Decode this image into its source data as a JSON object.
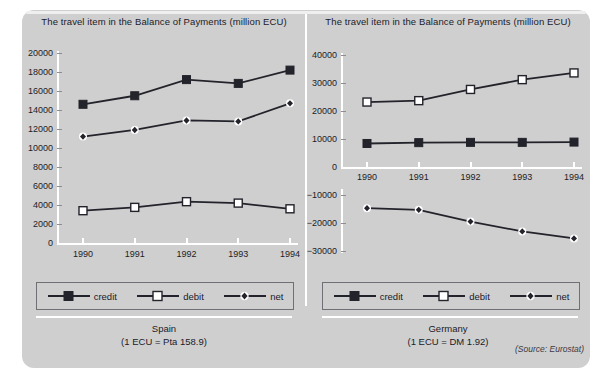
{
  "figure": {
    "source_note": "(Source: Eurostat)",
    "colors": {
      "card_background": "#cfcfcf",
      "page_background": "#ffffff",
      "axis": "#ffffff",
      "series_line": "#23232b",
      "credit_marker_fill": "#23232b",
      "debit_marker_fill": "#ffffff",
      "net_marker_fill": "#23232b",
      "text": "#20202a",
      "legend_border": "#6f6f76"
    }
  },
  "panels": [
    {
      "id": "spain",
      "title": "The travel item in the Balance of Payments (million ECU)",
      "caption_line1": "Spain",
      "caption_line2": "(1 ECU = Pta 158.9)",
      "legend": [
        {
          "label": "credit",
          "key": "filled-square-marker"
        },
        {
          "label": "debit",
          "key": "open-square-marker"
        },
        {
          "label": "net",
          "key": "small-diamond-marker"
        }
      ]
    },
    {
      "id": "germany",
      "title": "The travel item in the Balance of Payments (million ECU)",
      "caption_line1": "Germany",
      "caption_line2": "(1 ECU = DM 1.92)",
      "legend": [
        {
          "label": "credit",
          "key": "filled-square-marker"
        },
        {
          "label": "debit",
          "key": "open-square-marker"
        },
        {
          "label": "net",
          "key": "small-diamond-marker"
        }
      ]
    }
  ],
  "chart_data": [
    {
      "id": "spain",
      "type": "line",
      "title": "The travel item in the Balance of Payments (million ECU)",
      "subtitle": "Spain (1 ECU = Pta 158.9)",
      "xlabel": "",
      "ylabel": "million ECU",
      "categories": [
        "1990",
        "1991",
        "1992",
        "1993",
        "1994"
      ],
      "x": [
        1990,
        1991,
        1992,
        1993,
        1994
      ],
      "ylim": [
        0,
        20000
      ],
      "yticks": [
        0,
        2000,
        4000,
        6000,
        8000,
        10000,
        12000,
        14000,
        16000,
        18000,
        20000
      ],
      "ytick_labels": [
        "0",
        "2000",
        "4000",
        "6000",
        "8000",
        "10000",
        "12000",
        "14000",
        "16000",
        "18000",
        "20000"
      ],
      "grid": false,
      "legend_position": "bottom",
      "broken_axis": false,
      "series": [
        {
          "name": "credit",
          "marker": "filled-square",
          "values": [
            14600,
            15500,
            17200,
            16800,
            18200
          ]
        },
        {
          "name": "debit",
          "marker": "open-square",
          "values": [
            3400,
            3750,
            4350,
            4200,
            3600
          ]
        },
        {
          "name": "net",
          "marker": "small-diamond",
          "values": [
            11200,
            11900,
            12900,
            12800,
            14700
          ]
        }
      ]
    },
    {
      "id": "germany",
      "type": "line",
      "title": "The travel item in the Balance of Payments (million ECU)",
      "subtitle": "Germany (1 ECU = DM 1.92)",
      "xlabel": "",
      "ylabel": "million ECU",
      "categories": [
        "1990",
        "1991",
        "1992",
        "1993",
        "1994"
      ],
      "x": [
        1990,
        1991,
        1992,
        1993,
        1994
      ],
      "ylim": [
        -30000,
        40000
      ],
      "yticks": [
        -30000,
        -20000,
        -10000,
        0,
        10000,
        20000,
        30000,
        40000
      ],
      "ytick_labels": [
        "-30000",
        "-20000",
        "-10000",
        "0",
        "10000",
        "20000",
        "30000",
        "40000"
      ],
      "grid": false,
      "legend_position": "bottom",
      "broken_axis": true,
      "axis_note": "x-axis labels drawn between the 0 tick and the -10000 tick",
      "series": [
        {
          "name": "credit",
          "marker": "filled-square",
          "values": [
            8400,
            8700,
            8800,
            8800,
            8900
          ]
        },
        {
          "name": "debit",
          "marker": "open-square",
          "values": [
            23200,
            23700,
            27700,
            31200,
            33600
          ]
        },
        {
          "name": "net",
          "marker": "small-diamond",
          "values": [
            -14700,
            -15300,
            -19500,
            -23000,
            -25500
          ]
        }
      ]
    }
  ]
}
